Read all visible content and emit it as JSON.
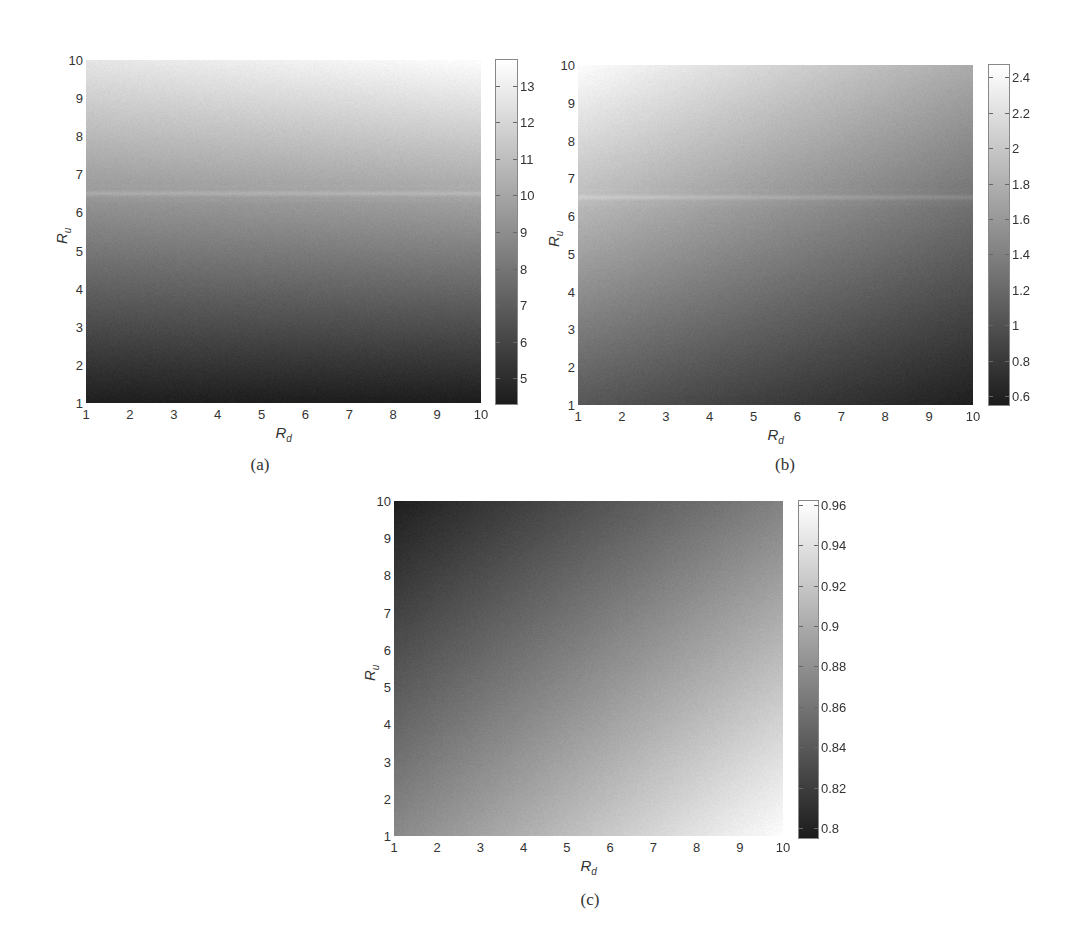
{
  "chart_data": [
    {
      "type": "heatmap",
      "caption": "(a)",
      "title": "",
      "xlabel": "R_d",
      "ylabel": "R_u",
      "xlabel_main": "R",
      "xlabel_sub": "d",
      "ylabel_main": "R",
      "ylabel_sub": "u",
      "xlim": [
        1,
        10
      ],
      "ylim": [
        1,
        10
      ],
      "x_ticks": [
        "1",
        "2",
        "3",
        "4",
        "5",
        "6",
        "7",
        "8",
        "9",
        "10"
      ],
      "y_ticks": [
        "1",
        "2",
        "3",
        "4",
        "5",
        "6",
        "7",
        "8",
        "9",
        "10"
      ],
      "colormap": "gray",
      "colorbar": {
        "min": 4.3,
        "max": 13.7,
        "ticks": [
          "5",
          "6",
          "7",
          "8",
          "9",
          "10",
          "11",
          "12",
          "13"
        ],
        "tick_values": [
          5,
          6,
          7,
          8,
          9,
          10,
          11,
          12,
          13
        ]
      },
      "corner_values": {
        "Rd1_Ru1": 4.4,
        "Rd10_Ru1": 4.3,
        "Rd1_Ru10": 12.6,
        "Rd10_Ru10": 13.6
      },
      "description": "Value increases primarily with R_u; nearly independent of R_d. Light horizontal band near R_u ≈ 6.3–6.7.",
      "band": {
        "ru_center": 6.5,
        "ru_halfwidth": 0.25,
        "boost": 0.08
      },
      "grid": false,
      "legend_position": "colorbar-right"
    },
    {
      "type": "heatmap",
      "caption": "(b)",
      "title": "",
      "xlabel": "R_d",
      "ylabel": "R_u",
      "xlabel_main": "R",
      "xlabel_sub": "d",
      "ylabel_main": "R",
      "ylabel_sub": "u",
      "xlim": [
        1,
        10
      ],
      "ylim": [
        1,
        10
      ],
      "x_ticks": [
        "1",
        "2",
        "3",
        "4",
        "5",
        "6",
        "7",
        "8",
        "9",
        "10"
      ],
      "y_ticks": [
        "1",
        "2",
        "3",
        "4",
        "5",
        "6",
        "7",
        "8",
        "9",
        "10"
      ],
      "colormap": "gray",
      "colorbar": {
        "min": 0.55,
        "max": 2.47,
        "ticks": [
          "0.6",
          "0.8",
          "1",
          "1.2",
          "1.4",
          "1.6",
          "1.8",
          "2",
          "2.2",
          "2.4"
        ],
        "tick_values": [
          0.6,
          0.8,
          1.0,
          1.2,
          1.4,
          1.6,
          1.8,
          2.0,
          2.2,
          2.4
        ]
      },
      "corner_values": {
        "Rd1_Ru1": 1.05,
        "Rd10_Ru1": 0.57,
        "Rd1_Ru10": 2.45,
        "Rd10_Ru10": 1.75
      },
      "description": "Maximum at low R_d / high R_u, minimum at high R_d / low R_u. Light horizontal band near R_u ≈ 6.3–6.7.",
      "band": {
        "ru_center": 6.5,
        "ru_halfwidth": 0.25,
        "boost": 0.08
      },
      "grid": false,
      "legend_position": "colorbar-right"
    },
    {
      "type": "heatmap",
      "caption": "(c)",
      "title": "",
      "xlabel": "R_d",
      "ylabel": "R_u",
      "xlabel_main": "R",
      "xlabel_sub": "d",
      "ylabel_main": "R",
      "ylabel_sub": "u",
      "xlim": [
        1,
        10
      ],
      "ylim": [
        1,
        10
      ],
      "x_ticks": [
        "1",
        "2",
        "3",
        "4",
        "5",
        "6",
        "7",
        "8",
        "9",
        "10"
      ],
      "y_ticks": [
        "1",
        "2",
        "3",
        "4",
        "5",
        "6",
        "7",
        "8",
        "9",
        "10"
      ],
      "colormap": "gray",
      "colorbar": {
        "min": 0.795,
        "max": 0.962,
        "ticks": [
          "0.8",
          "0.82",
          "0.84",
          "0.86",
          "0.88",
          "0.9",
          "0.92",
          "0.94",
          "0.96"
        ],
        "tick_values": [
          0.8,
          0.82,
          0.84,
          0.86,
          0.88,
          0.9,
          0.92,
          0.94,
          0.96
        ]
      },
      "corner_values": {
        "Rd1_Ru1": 0.875,
        "Rd10_Ru1": 0.96,
        "Rd1_Ru10": 0.797,
        "Rd10_Ru10": 0.87
      },
      "description": "Minimum at low R_d / high R_u, maximum at high R_d / low R_u.",
      "band": null,
      "grid": false,
      "legend_position": "colorbar-right"
    }
  ],
  "layout": [
    {
      "plot": [
        86,
        60,
        395,
        343
      ],
      "cbar": [
        496,
        60,
        21,
        344
      ]
    },
    {
      "plot": [
        578,
        65,
        395,
        340
      ],
      "cbar": [
        989,
        65,
        20,
        340
      ]
    },
    {
      "plot": [
        394,
        501,
        389,
        335
      ],
      "cbar": [
        799,
        501,
        19,
        337
      ]
    }
  ]
}
